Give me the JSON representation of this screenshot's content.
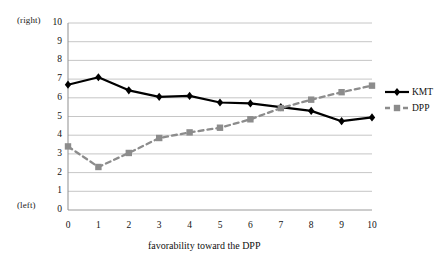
{
  "chart_data": {
    "type": "line",
    "title": "",
    "subtitle": "",
    "xlabel": "favorability toward the DPP",
    "ylabel": "",
    "x": [
      0,
      1,
      2,
      3,
      4,
      5,
      6,
      7,
      8,
      9,
      10
    ],
    "categories": [
      "0",
      "1",
      "2",
      "3",
      "4",
      "5",
      "6",
      "7",
      "8",
      "9",
      "10"
    ],
    "series": [
      {
        "name": "KMT",
        "color": "#000000",
        "marker": "diamond",
        "linestyle": "solid",
        "values": [
          6.7,
          7.1,
          6.4,
          6.05,
          6.1,
          5.75,
          5.7,
          5.5,
          5.3,
          4.75,
          4.95
        ]
      },
      {
        "name": "DPP",
        "color": "#8c8c8c",
        "marker": "square",
        "linestyle": "dashed",
        "values": [
          3.4,
          2.3,
          3.05,
          3.85,
          4.15,
          4.4,
          4.85,
          5.45,
          5.9,
          6.3,
          6.65
        ]
      }
    ],
    "ylim": [
      0,
      10
    ],
    "xlim": [
      0,
      10
    ],
    "yticks": [
      0,
      1,
      2,
      3,
      4,
      5,
      6,
      7,
      8,
      9,
      10
    ],
    "ytick_labels": [
      "0",
      "1",
      "2",
      "3",
      "4",
      "5",
      "6",
      "7",
      "8",
      "9",
      "10"
    ],
    "xtick_labels": [
      "0",
      "1",
      "2",
      "3",
      "4",
      "5",
      "6",
      "7",
      "8",
      "9",
      "10"
    ],
    "grid": "horizontal",
    "legend_position": "right",
    "annotations": {
      "y_axis_top_note": "(right)",
      "y_axis_bottom_note": "(left)"
    }
  },
  "legend": {
    "entries": [
      {
        "label": "KMT"
      },
      {
        "label": "DPP"
      }
    ]
  }
}
